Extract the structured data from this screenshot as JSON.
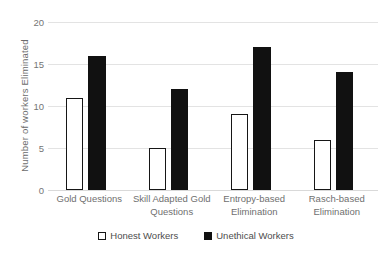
{
  "chart_data": {
    "type": "bar",
    "title": "",
    "xlabel": "",
    "ylabel": "Number of workers Eliminated",
    "ylim": [
      0,
      20
    ],
    "yticks": [
      0,
      5,
      10,
      15,
      20
    ],
    "ytick_labels": [
      "0",
      "5",
      "10",
      "15",
      "20"
    ],
    "grid": true,
    "legend_position": "bottom-center",
    "categories": [
      "Gold Questions",
      "Skill Adapted Gold Questions",
      "Entropy-based Elimination",
      "Rasch-based Elimination"
    ],
    "series": [
      {
        "name": "Honest Workers",
        "color": "#ffffff",
        "edge_color": "#161616",
        "values": [
          11,
          5,
          9,
          6
        ]
      },
      {
        "name": "Unethical Workers",
        "color": "#111111",
        "edge_color": "#111111",
        "values": [
          16,
          12,
          17,
          14
        ]
      }
    ]
  },
  "axis": {
    "y_title": "Number of workers Eliminated",
    "y_ticks": [
      "20",
      "15",
      "10",
      "5",
      "0"
    ],
    "x_categories": [
      "Gold Questions",
      "Skill Adapted Gold Questions",
      "Entropy-based Elimination",
      "Rasch-based Elimination"
    ]
  },
  "legend": {
    "items": [
      {
        "label": "Honest Workers",
        "swatch": "white-square-black-border"
      },
      {
        "label": "Unethical Workers",
        "swatch": "filled-black-square"
      }
    ]
  },
  "colors": {
    "honest_fill": "#ffffff",
    "honest_edge": "#161616",
    "unethical_fill": "#111111",
    "gridline": "#e3e3e3",
    "text": "#6f6f6f",
    "background": "#ffffff"
  }
}
